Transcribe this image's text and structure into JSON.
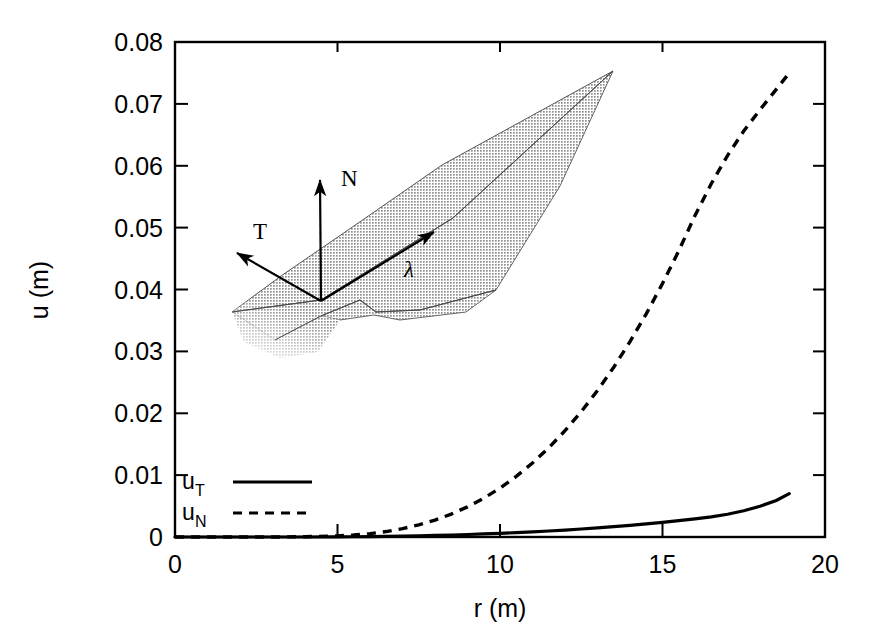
{
  "figure": {
    "background_color": "#ffffff",
    "line_color": "#000000"
  },
  "chart_data": {
    "type": "line",
    "title": "",
    "xlabel": "r (m)",
    "ylabel": "u (m)",
    "xlim": [
      0,
      20
    ],
    "ylim": [
      0,
      0.08
    ],
    "grid": false,
    "legend_position": "bottom-left-inside",
    "xticks": [
      "0",
      "5",
      "10",
      "15",
      "20"
    ],
    "xtick_values": [
      0,
      5,
      10,
      15,
      20
    ],
    "yticks": [
      "0",
      "0.01",
      "0.02",
      "0.03",
      "0.04",
      "0.05",
      "0.06",
      "0.07",
      "0.08"
    ],
    "ytick_values": [
      0,
      0.01,
      0.02,
      0.03,
      0.04,
      0.05,
      0.06,
      0.07,
      0.08
    ],
    "x": [
      0,
      1,
      2,
      3,
      4,
      5,
      5.5,
      6,
      6.5,
      7,
      7.5,
      8,
      8.5,
      9,
      9.5,
      10,
      10.5,
      11,
      11.5,
      12,
      12.5,
      13,
      13.5,
      14,
      14.5,
      15,
      15.5,
      16,
      16.5,
      17,
      17.5,
      18,
      18.5,
      18.9
    ],
    "series": [
      {
        "name": "u_T",
        "label": "u",
        "subscript": "T",
        "style": "solid",
        "values": [
          0,
          0,
          0,
          0,
          0,
          2e-05,
          4e-05,
          7e-05,
          0.0001,
          0.00014,
          0.00019,
          0.00025,
          0.00032,
          0.0004,
          0.00049,
          0.00059,
          0.0007,
          0.00083,
          0.00097,
          0.00112,
          0.00129,
          0.00147,
          0.00167,
          0.00189,
          0.00212,
          0.00237,
          0.00264,
          0.00293,
          0.00325,
          0.00368,
          0.00424,
          0.00497,
          0.0059,
          0.007
        ]
      },
      {
        "name": "u_N",
        "label": "u",
        "subscript": "N",
        "style": "dashed",
        "values": [
          0,
          0,
          0,
          0,
          5e-05,
          0.00018,
          0.00032,
          0.00055,
          0.00088,
          0.00135,
          0.00196,
          0.00274,
          0.0037,
          0.00487,
          0.00626,
          0.0079,
          0.00979,
          0.01196,
          0.01442,
          0.01718,
          0.02026,
          0.02368,
          0.02744,
          0.03157,
          0.03607,
          0.04096,
          0.04625,
          0.05196,
          0.05709,
          0.06164,
          0.06562,
          0.06905,
          0.07234,
          0.075
        ]
      }
    ]
  },
  "legend": {
    "entries": [
      {
        "label": "u",
        "subscript": "T",
        "style": "solid"
      },
      {
        "label": "u",
        "subscript": "N",
        "style": "dashed"
      }
    ]
  },
  "inset": {
    "description": "shaded fault surface with local coordinate vectors",
    "fill_color": "#a8a8a8",
    "vectors": [
      {
        "name": "N",
        "label": "N",
        "direction": "up"
      },
      {
        "name": "T",
        "label": "T",
        "direction": "upper-left"
      },
      {
        "name": "lambda",
        "label": "λ",
        "direction": "upper-right"
      }
    ]
  }
}
